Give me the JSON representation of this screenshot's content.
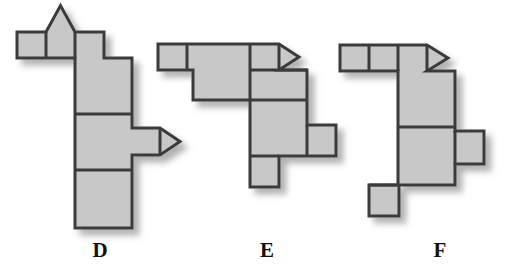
{
  "figure": {
    "title": "",
    "background_color": "#ffffff",
    "piece_fill": "#c8c8c8",
    "piece_stroke": "#3b3b3b",
    "shadow_color": "#b4b4b4",
    "label_color": "#111111",
    "stroke_width": 3,
    "shapes": [
      {
        "id": "D",
        "label": "D",
        "label_x": 100,
        "label_y": 240,
        "description": "Inverted L polyomino: three small squares in a top row with a triangular bump on the middle one, a vertical column of three large squares below the right end, and a small square with a right-pointing arrow head on the middle-right side.",
        "parts": [
          {
            "name": "top-row-square-1",
            "type": "rect",
            "x": 17,
            "y": 32,
            "w": 29,
            "h": 26
          },
          {
            "name": "top-row-square-2",
            "type": "rect",
            "x": 46,
            "y": 32,
            "w": 29,
            "h": 26
          },
          {
            "name": "top-row-square-3",
            "type": "rect",
            "x": 75,
            "y": 32,
            "w": 29,
            "h": 26
          },
          {
            "name": "top-bump-triangle",
            "type": "triangle-up",
            "x": 46,
            "y": 32,
            "w": 29,
            "h": 27
          },
          {
            "name": "column-square-1",
            "type": "rect",
            "x": 75,
            "y": 58,
            "w": 57,
            "h": 56
          },
          {
            "name": "column-square-2",
            "type": "rect",
            "x": 75,
            "y": 114,
            "w": 57,
            "h": 56
          },
          {
            "name": "column-square-3",
            "type": "rect",
            "x": 75,
            "y": 170,
            "w": 57,
            "h": 58
          },
          {
            "name": "side-tab-square",
            "type": "rect",
            "x": 132,
            "y": 128,
            "w": 28,
            "h": 27
          },
          {
            "name": "side-tab-arrow",
            "type": "triangle-right",
            "x": 160,
            "y": 128,
            "w": 20,
            "h": 27
          }
        ]
      },
      {
        "id": "E",
        "label": "E",
        "label_x": 267,
        "label_y": 240,
        "description": "Polyomino: small square at upper left, large square center, small square with right-pointing arrow head at top right, a wide rectangle second row right, a large square third row, a small square tab on its right and a small square tab below on its left.",
        "parts": [
          {
            "name": "top-left-small-square",
            "type": "rect",
            "x": 158,
            "y": 44,
            "w": 29,
            "h": 26
          },
          {
            "name": "center-large-square",
            "type": "rect",
            "x": 193,
            "y": 44,
            "w": 57,
            "h": 56
          },
          {
            "name": "top-right-small-square",
            "type": "rect",
            "x": 250,
            "y": 44,
            "w": 29,
            "h": 26
          },
          {
            "name": "top-right-arrow",
            "type": "triangle-right",
            "x": 279,
            "y": 44,
            "w": 20,
            "h": 26
          },
          {
            "name": "second-row-rect",
            "type": "rect",
            "x": 250,
            "y": 70,
            "w": 57,
            "h": 30
          },
          {
            "name": "third-row-large-square",
            "type": "rect",
            "x": 250,
            "y": 100,
            "w": 57,
            "h": 56
          },
          {
            "name": "right-tab-square",
            "type": "rect",
            "x": 307,
            "y": 125,
            "w": 29,
            "h": 31
          },
          {
            "name": "bottom-tab-square",
            "type": "rect",
            "x": 250,
            "y": 156,
            "w": 29,
            "h": 31
          }
        ]
      },
      {
        "id": "F",
        "label": "F",
        "label_x": 440,
        "label_y": 240,
        "description": "Inverted L polyomino: three small squares in a top row ending in a right-pointing arrow head, a vertical column of two large squares below the right end, a small square tab on the middle right, and a small square tab at the bottom left.",
        "parts": [
          {
            "name": "top-row-square-1",
            "type": "rect",
            "x": 340,
            "y": 45,
            "w": 29,
            "h": 26
          },
          {
            "name": "top-row-square-2",
            "type": "rect",
            "x": 369,
            "y": 45,
            "w": 29,
            "h": 26
          },
          {
            "name": "top-row-square-3",
            "type": "rect",
            "x": 398,
            "y": 45,
            "w": 29,
            "h": 26
          },
          {
            "name": "top-row-arrow",
            "type": "triangle-right",
            "x": 427,
            "y": 45,
            "w": 21,
            "h": 26
          },
          {
            "name": "column-square-1",
            "type": "rect",
            "x": 398,
            "y": 71,
            "w": 57,
            "h": 56
          },
          {
            "name": "column-square-2",
            "type": "rect",
            "x": 398,
            "y": 127,
            "w": 57,
            "h": 58
          },
          {
            "name": "right-tab-square",
            "type": "rect",
            "x": 455,
            "y": 131,
            "w": 29,
            "h": 33
          },
          {
            "name": "bottom-tab-square",
            "type": "rect",
            "x": 369,
            "y": 185,
            "w": 30,
            "h": 31
          }
        ]
      }
    ]
  }
}
